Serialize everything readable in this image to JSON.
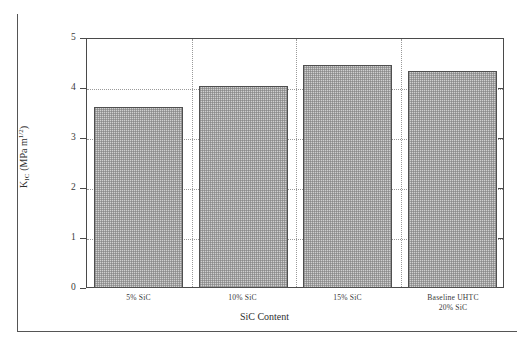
{
  "chart_data": {
    "type": "bar",
    "title": "",
    "xlabel": "SiC Content",
    "ylabel": "K_IC (MPa·m^1/2)",
    "ylabel_parts": {
      "symbol": "K",
      "subscript": "IC",
      "unit_open": " (MPa m",
      "superscript": "1/2",
      "unit_close": ")"
    },
    "categories": [
      "5% SiC",
      "10% SiC",
      "15% SiC",
      "Baseline UHTC\n20% SiC"
    ],
    "category_lines": [
      [
        "5% SiC"
      ],
      [
        "10% SiC"
      ],
      [
        "15% SiC"
      ],
      [
        "Baseline UHTC",
        "20% SiC"
      ]
    ],
    "values": [
      3.63,
      4.05,
      4.47,
      4.35
    ],
    "ylim": [
      0,
      5
    ],
    "yticks": [
      0,
      1,
      2,
      3,
      4,
      5
    ],
    "ytick_labels": [
      "0",
      "1",
      "2",
      "3",
      "4",
      "5"
    ],
    "grid": "dotted-horizontal-and-vertical",
    "legend": "none",
    "bar_fill_color": "#cfcfcf",
    "bar_edge_color": "#4f4f4f",
    "axis_color": "#4a4a4a",
    "grid_color": "#9a9a9a",
    "background_color": "#ffffff"
  }
}
